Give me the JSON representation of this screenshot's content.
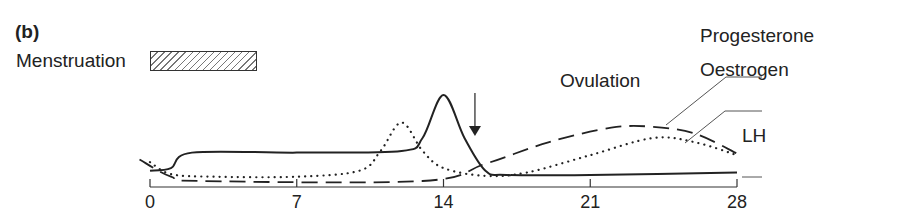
{
  "panel": {
    "label": "(b)"
  },
  "legend": {
    "menstruation_label": "Menstruation",
    "menstruation_days": [
      0,
      4
    ]
  },
  "annotations": {
    "ovulation_label": "Ovulation",
    "ovulation_day": 15.5
  },
  "series_labels": {
    "progesterone": "Progesterone",
    "oestrogen": "Oestrogen",
    "lh": "LH"
  },
  "axis": {
    "ticks": [
      "0",
      "7",
      "14",
      "21",
      "28"
    ]
  },
  "chart_data": {
    "type": "line",
    "title": "(b)",
    "xlabel": "Day of cycle",
    "ylabel": "",
    "xlim": [
      0,
      28
    ],
    "x_ticks": [
      0,
      7,
      14,
      21,
      28
    ],
    "grid": false,
    "series": [
      {
        "name": "LH",
        "style": "solid",
        "x": [
          0,
          1,
          2,
          7,
          12,
          13,
          14,
          15,
          16,
          17,
          21,
          28
        ],
        "y": [
          0.12,
          0.15,
          0.33,
          0.33,
          0.35,
          0.5,
          1.0,
          0.5,
          0.12,
          0.07,
          0.07,
          0.1
        ]
      },
      {
        "name": "Oestrogen",
        "style": "dotted",
        "x": [
          0,
          1,
          3,
          7,
          10,
          11,
          12,
          13,
          14,
          16,
          18,
          21,
          24,
          26,
          28
        ],
        "y": [
          0.22,
          0.08,
          0.05,
          0.05,
          0.12,
          0.35,
          0.68,
          0.35,
          0.15,
          0.06,
          0.1,
          0.3,
          0.5,
          0.45,
          0.3
        ]
      },
      {
        "name": "Progesterone",
        "style": "dashed",
        "x": [
          -0.5,
          1,
          2.5,
          13,
          16,
          19,
          22,
          24,
          26,
          28
        ],
        "y": [
          0.25,
          0.05,
          0.0,
          0.0,
          0.2,
          0.45,
          0.62,
          0.63,
          0.55,
          0.32
        ]
      }
    ]
  }
}
